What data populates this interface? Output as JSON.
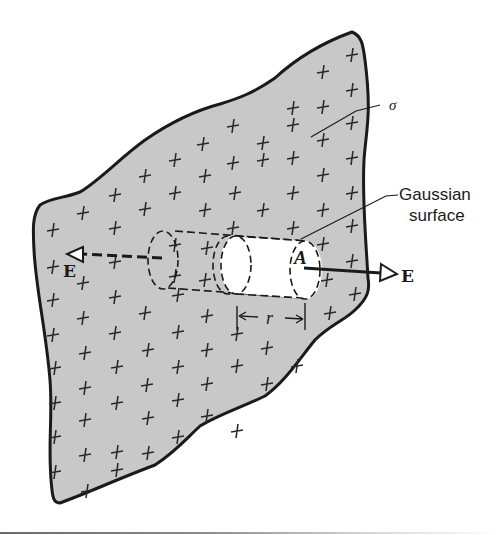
{
  "figure": {
    "labels": {
      "sigma": "σ",
      "gaussian_surface_line1": "Gaussian",
      "gaussian_surface_line2": "surface",
      "area": "A",
      "radius": "r",
      "field_left": "E",
      "field_right": "E"
    },
    "colors": {
      "sheet_fill": "#c8c8c8",
      "outline": "#1a1a1a",
      "cylinder_fill": "#ffffff",
      "background": "#ffffff"
    },
    "charge_symbol": "+"
  }
}
